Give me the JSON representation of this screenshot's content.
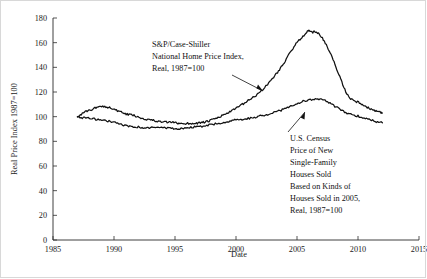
{
  "chart_data": {
    "type": "line",
    "title": "",
    "xlabel": "Date",
    "ylabel": "Real Price Index 1987=100",
    "xlim": [
      1985,
      2015
    ],
    "ylim": [
      0,
      180
    ],
    "xticks": [
      1985,
      1990,
      1995,
      2000,
      2005,
      2010,
      2015
    ],
    "yticks": [
      0,
      20,
      40,
      60,
      80,
      100,
      120,
      140,
      160,
      180
    ],
    "grid": false,
    "legend_position": "none",
    "annotations": [
      {
        "id": "case-shiller",
        "lines": [
          "S&P/Case-Shiller",
          "National Home Price Index,",
          "Real, 1987=100"
        ],
        "arrow": true
      },
      {
        "id": "us-census",
        "lines": [
          "U.S. Census",
          "Price of New",
          "Single-Family",
          "Houses Sold",
          "Based on Kinds of",
          "Houses Sold in 2005,",
          "Real, 1987=100"
        ],
        "arrow": true
      }
    ],
    "series": [
      {
        "name": "S&P/Case-Shiller National Home Price Index, Real, 1987=100",
        "x": [
          1987.0,
          1987.4,
          1987.8,
          1988.2,
          1988.6,
          1989.0,
          1989.4,
          1989.8,
          1990.2,
          1990.6,
          1991.0,
          1991.4,
          1991.8,
          1992.2,
          1992.6,
          1993.0,
          1993.4,
          1993.8,
          1994.2,
          1994.6,
          1995.0,
          1995.4,
          1995.8,
          1996.2,
          1996.6,
          1997.0,
          1997.4,
          1997.8,
          1998.2,
          1998.6,
          1999.0,
          1999.4,
          1999.8,
          2000.2,
          2000.6,
          2001.0,
          2001.4,
          2001.8,
          2002.2,
          2002.6,
          2003.0,
          2003.4,
          2003.8,
          2004.2,
          2004.6,
          2005.0,
          2005.4,
          2005.8,
          2006.0,
          2006.3,
          2006.6,
          2007.0,
          2007.4,
          2007.8,
          2008.2,
          2008.6,
          2009.0,
          2009.4,
          2009.8,
          2010.2,
          2010.6,
          2011.0,
          2011.4,
          2011.8,
          2012.0
        ],
        "y": [
          100.0,
          102.5,
          104.5,
          106.0,
          107.5,
          108.5,
          108.0,
          107.0,
          105.0,
          103.5,
          102.0,
          101.5,
          100.5,
          99.0,
          98.0,
          97.5,
          96.5,
          96.0,
          95.5,
          95.5,
          95.0,
          94.5,
          94.5,
          94.5,
          94.5,
          95.0,
          95.5,
          96.5,
          98.0,
          99.5,
          101.5,
          103.5,
          105.5,
          108.0,
          110.5,
          113.0,
          115.5,
          118.5,
          122.0,
          126.5,
          131.0,
          136.0,
          141.5,
          148.0,
          154.5,
          160.0,
          164.5,
          168.5,
          170.0,
          168.5,
          169.0,
          165.0,
          158.0,
          150.0,
          140.0,
          130.0,
          120.0,
          114.5,
          112.5,
          111.0,
          108.0,
          106.5,
          104.5,
          103.5,
          103.0
        ]
      },
      {
        "name": "U.S. Census Price of New Single-Family Houses Sold Based on Kinds of Houses Sold in 2005, Real, 1987=100",
        "x": [
          1987.0,
          1987.5,
          1988.0,
          1988.5,
          1989.0,
          1989.5,
          1990.0,
          1990.5,
          1991.0,
          1991.5,
          1992.0,
          1992.5,
          1993.0,
          1993.5,
          1994.0,
          1994.5,
          1995.0,
          1995.5,
          1996.0,
          1996.5,
          1997.0,
          1997.5,
          1998.0,
          1998.5,
          1999.0,
          1999.5,
          2000.0,
          2000.5,
          2001.0,
          2001.5,
          2002.0,
          2002.5,
          2003.0,
          2003.5,
          2004.0,
          2004.5,
          2005.0,
          2005.5,
          2006.0,
          2006.5,
          2007.0,
          2007.5,
          2008.0,
          2008.5,
          2009.0,
          2009.5,
          2010.0,
          2010.5,
          2011.0,
          2011.5,
          2012.0
        ],
        "y": [
          100.0,
          99.0,
          98.5,
          98.0,
          97.5,
          96.5,
          95.5,
          94.0,
          92.5,
          92.0,
          91.5,
          90.5,
          91.0,
          91.5,
          91.0,
          90.5,
          90.0,
          90.5,
          91.0,
          91.5,
          92.0,
          92.5,
          93.5,
          94.5,
          95.5,
          96.5,
          97.5,
          98.0,
          98.5,
          99.5,
          100.5,
          101.5,
          103.0,
          104.5,
          106.5,
          108.5,
          110.5,
          112.5,
          113.5,
          114.5,
          114.0,
          112.0,
          109.0,
          106.0,
          103.0,
          101.5,
          100.5,
          99.0,
          97.5,
          96.0,
          95.0
        ]
      }
    ]
  },
  "axes": {
    "x_label": "Date",
    "y_label": "Real Price Index 1987=100",
    "x_tick_labels": [
      "1985",
      "1990",
      "1995",
      "2000",
      "2005",
      "2010",
      "2015"
    ],
    "y_tick_labels": [
      "0",
      "20",
      "40",
      "60",
      "80",
      "100",
      "120",
      "140",
      "160",
      "180"
    ]
  },
  "annotation_case_shiller": {
    "line1": "S&P/Case-Shiller",
    "line2": "National Home Price Index,",
    "line3": "Real, 1987=100"
  },
  "annotation_us_census": {
    "line1": "U.S. Census",
    "line2": "Price of New",
    "line3": "Single-Family",
    "line4": "Houses Sold",
    "line5": "Based on Kinds of",
    "line6": "Houses Sold in 2005,",
    "line7": "Real, 1987=100"
  },
  "colors": {
    "line": "#111111",
    "axis": "#2b2b2b",
    "background": "#ffffff"
  }
}
